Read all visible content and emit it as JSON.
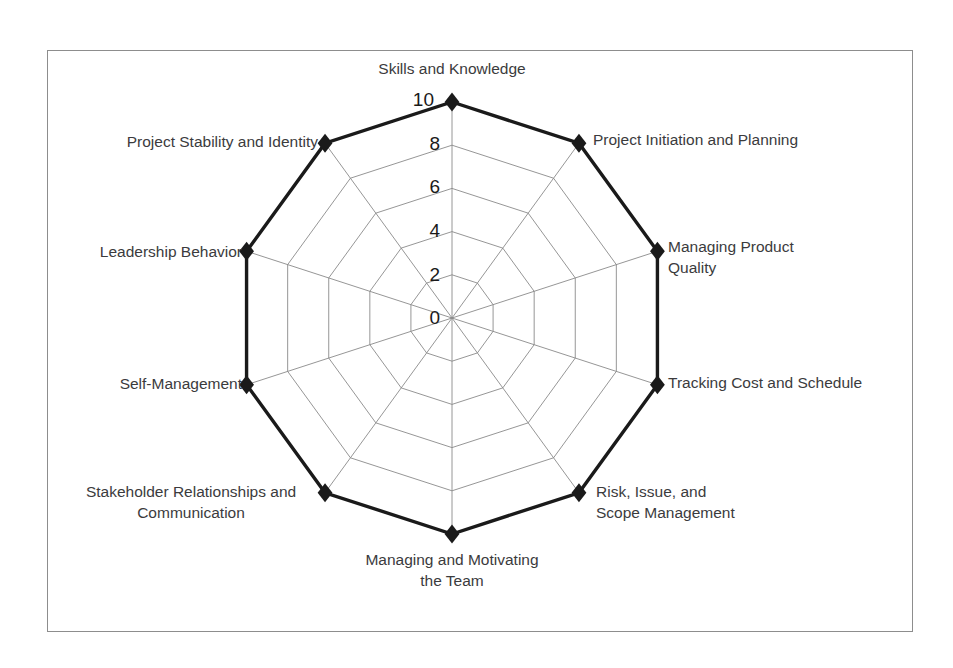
{
  "chart_data": {
    "type": "radar",
    "title": "",
    "subtitle": "",
    "xlabel": "",
    "ylabel": "",
    "grid": true,
    "legend": "none",
    "rlim": [
      0,
      10
    ],
    "radial_ticks": [
      "0",
      "2",
      "4",
      "6",
      "8",
      "10"
    ],
    "radial_tick_values": [
      0,
      2,
      4,
      6,
      8,
      10
    ],
    "categories": [
      "Skills and Knowledge",
      "Project Initiation and Planning",
      "Managing Product Quality",
      "Tracking Cost and Schedule",
      "Risk, Issue, and Scope Management",
      "Managing and Motivating the Team",
      "Stakeholder Relationships and Communication",
      "Self-Management",
      "Leadership Behavior",
      "Project Stability and Identity"
    ],
    "series": [
      {
        "name": "Competency Score",
        "values": [
          10,
          10,
          10,
          10,
          10,
          10,
          10,
          10,
          10,
          10
        ],
        "marker": "diamond",
        "color": "#1a1a1a"
      }
    ]
  },
  "axis_labels": [
    {
      "text": "Skills and Knowledge",
      "lines": [
        "Skills and Knowledge"
      ],
      "anchor": "middle",
      "x": 452,
      "y": 74
    },
    {
      "text": "Project Initiation and Planning",
      "lines": [
        "Project Initiation and Planning"
      ],
      "anchor": "start",
      "x": 593,
      "y": 145
    },
    {
      "text": "Managing Product Quality",
      "lines": [
        "Managing Product",
        "Quality"
      ],
      "anchor": "start",
      "x": 668,
      "y": 252
    },
    {
      "text": "Tracking Cost and Schedule",
      "lines": [
        "Tracking Cost and Schedule"
      ],
      "anchor": "start",
      "x": 668,
      "y": 388
    },
    {
      "text": "Risk, Issue, and Scope Management",
      "lines": [
        "Risk, Issue, and",
        "Scope Management"
      ],
      "anchor": "start",
      "x": 596,
      "y": 497
    },
    {
      "text": "Managing and Motivating the Team",
      "lines": [
        "Managing and Motivating",
        "the Team"
      ],
      "anchor": "middle",
      "x": 452,
      "y": 565
    },
    {
      "text": "Stakeholder Relationships and Communication",
      "lines": [
        "Stakeholder Relationships and",
        "Communication"
      ],
      "anchor": "middle",
      "x": 191,
      "y": 497
    },
    {
      "text": "Self-Management",
      "lines": [
        "Self-Management"
      ],
      "anchor": "end",
      "x": 242,
      "y": 389
    },
    {
      "text": "Leadership Behavior",
      "lines": [
        "Leadership Behavior",
        ""
      ],
      "anchor": "end",
      "x": 242,
      "y": 257
    },
    {
      "text": "Project Stability and Identity",
      "lines": [
        "Project Stability and Identity"
      ],
      "anchor": "end",
      "x": 318,
      "y": 147
    }
  ],
  "radial_labels": [
    {
      "value": 10,
      "text": "10",
      "x": 434,
      "y": 106
    },
    {
      "value": 8,
      "text": "8",
      "x": 440,
      "y": 150
    },
    {
      "value": 6,
      "text": "6",
      "x": 440,
      "y": 193
    },
    {
      "value": 4,
      "text": "4",
      "x": 440,
      "y": 237
    },
    {
      "value": 2,
      "text": "2",
      "x": 440,
      "y": 281
    },
    {
      "value": 0,
      "text": "0",
      "x": 440,
      "y": 324
    }
  ],
  "colors": {
    "series": "#1a1a1a",
    "grid": "#8a8a8a",
    "frame": "#8d8d8d",
    "label_text": "#3b3b3d",
    "background": "#ffffff"
  },
  "geometry": {
    "center_x": 452,
    "center_y": 318,
    "radius_max": 216,
    "start_angle_deg": -90,
    "axis_count": 10,
    "ring_count": 5
  }
}
